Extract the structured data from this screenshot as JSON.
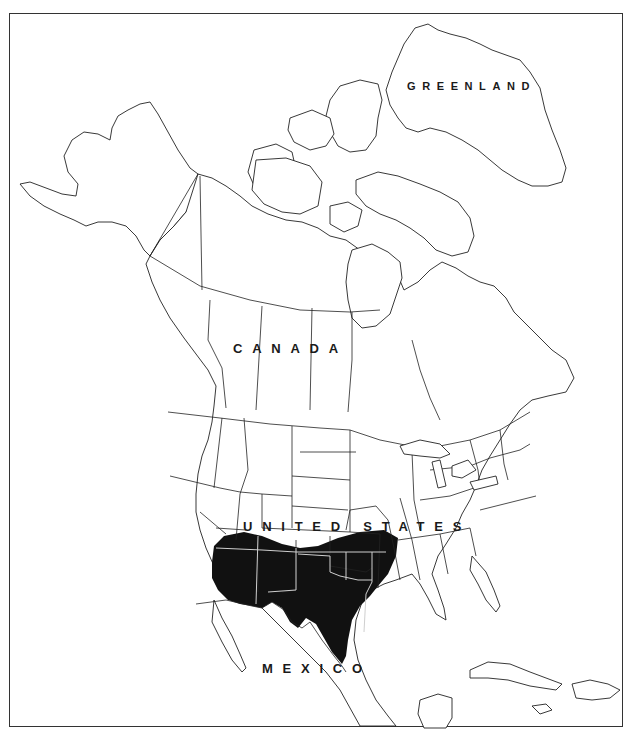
{
  "map": {
    "type": "range-map",
    "region": "North America",
    "labels": {
      "greenland": "GREENLAND",
      "canada": "CANADA",
      "united_states": "UNITED STATES",
      "mexico": "MEXICO"
    },
    "range": {
      "fill_color": "#111111",
      "description": "Shaded distribution range across the south-central / southwestern United States",
      "covered_areas": [
        "Arizona",
        "New Mexico",
        "Texas",
        "Oklahoma",
        "southern Utah",
        "southern Colorado",
        "southern Kansas",
        "southern Missouri",
        "Arkansas",
        "northwest Louisiana"
      ]
    },
    "colors": {
      "background": "#ffffff",
      "outline": "#222222",
      "range": "#111111",
      "frame": "#333333"
    }
  }
}
